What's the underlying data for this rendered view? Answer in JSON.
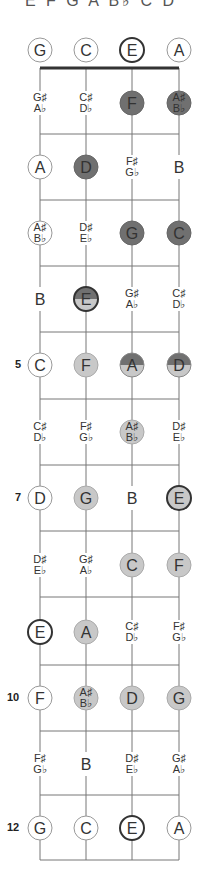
{
  "header": {
    "scale_notes": "E F G A B♭ C D"
  },
  "colors": {
    "line": "#777777",
    "nut": "#333333",
    "dark": "#707070",
    "light": "#c8c8c8",
    "open_outline": "#999999",
    "root_outline": "#333333"
  },
  "strings": [
    {
      "name": "G",
      "x": 40
    },
    {
      "name": "C",
      "x": 86
    },
    {
      "name": "E",
      "x": 132
    },
    {
      "name": "A",
      "x": 179
    }
  ],
  "fret_markers": [
    {
      "fret": 5,
      "label": "5"
    },
    {
      "fret": 7,
      "label": "7"
    },
    {
      "fret": 10,
      "label": "10"
    },
    {
      "fret": 12,
      "label": "12"
    }
  ],
  "rows": [
    {
      "fret": 0,
      "y": 50,
      "cells": [
        {
          "note": "G",
          "style": "open"
        },
        {
          "note": "C",
          "style": "open"
        },
        {
          "note": "E",
          "style": "root"
        },
        {
          "note": "A",
          "style": "open"
        }
      ]
    },
    {
      "fret": 1,
      "y": 103,
      "cells": [
        {
          "note": "G♯/A♭",
          "style": "none"
        },
        {
          "note": "C♯/D♭",
          "style": "none"
        },
        {
          "note": "F",
          "style": "dark"
        },
        {
          "note": "A♯/B♭",
          "style": "dark"
        }
      ]
    },
    {
      "fret": 2,
      "y": 167,
      "cells": [
        {
          "note": "A",
          "style": "open"
        },
        {
          "note": "D",
          "style": "dark"
        },
        {
          "note": "F♯/G♭",
          "style": "none"
        },
        {
          "note": "B",
          "style": "none"
        }
      ]
    },
    {
      "fret": 3,
      "y": 233,
      "cells": [
        {
          "note": "A♯/B♭",
          "style": "open"
        },
        {
          "note": "D♯/E♭",
          "style": "none"
        },
        {
          "note": "G",
          "style": "dark"
        },
        {
          "note": "C",
          "style": "dark"
        }
      ]
    },
    {
      "fret": 4,
      "y": 299,
      "cells": [
        {
          "note": "B",
          "style": "none"
        },
        {
          "note": "E",
          "style": "split-root"
        },
        {
          "note": "G♯/A♭",
          "style": "none"
        },
        {
          "note": "C♯/D♭",
          "style": "none"
        }
      ]
    },
    {
      "fret": 5,
      "y": 365,
      "cells": [
        {
          "note": "C",
          "style": "open"
        },
        {
          "note": "F",
          "style": "light"
        },
        {
          "note": "A",
          "style": "split"
        },
        {
          "note": "D",
          "style": "split"
        }
      ]
    },
    {
      "fret": 6,
      "y": 432,
      "cells": [
        {
          "note": "C♯/D♭",
          "style": "none"
        },
        {
          "note": "F♯/G♭",
          "style": "none"
        },
        {
          "note": "A♯/B♭",
          "style": "light"
        },
        {
          "note": "D♯/E♭",
          "style": "none"
        }
      ]
    },
    {
      "fret": 7,
      "y": 498,
      "cells": [
        {
          "note": "D",
          "style": "open"
        },
        {
          "note": "G",
          "style": "light"
        },
        {
          "note": "B",
          "style": "none"
        },
        {
          "note": "E",
          "style": "light-root"
        }
      ]
    },
    {
      "fret": 8,
      "y": 565,
      "cells": [
        {
          "note": "D♯/E♭",
          "style": "none"
        },
        {
          "note": "G♯/A♭",
          "style": "none"
        },
        {
          "note": "C",
          "style": "light"
        },
        {
          "note": "F",
          "style": "light"
        }
      ]
    },
    {
      "fret": 9,
      "y": 632,
      "cells": [
        {
          "note": "E",
          "style": "root"
        },
        {
          "note": "A",
          "style": "light"
        },
        {
          "note": "C♯/D♭",
          "style": "none"
        },
        {
          "note": "F♯/G♭",
          "style": "none"
        }
      ]
    },
    {
      "fret": 10,
      "y": 698,
      "cells": [
        {
          "note": "F",
          "style": "open"
        },
        {
          "note": "A♯/B♭",
          "style": "light"
        },
        {
          "note": "D",
          "style": "light"
        },
        {
          "note": "G",
          "style": "light"
        }
      ]
    },
    {
      "fret": 11,
      "y": 764,
      "cells": [
        {
          "note": "F♯/G♭",
          "style": "none"
        },
        {
          "note": "B",
          "style": "none"
        },
        {
          "note": "D♯/E♭",
          "style": "none"
        },
        {
          "note": "G♯/A♭",
          "style": "none"
        }
      ]
    },
    {
      "fret": 12,
      "y": 828,
      "cells": [
        {
          "note": "G",
          "style": "open"
        },
        {
          "note": "C",
          "style": "open"
        },
        {
          "note": "E",
          "style": "root"
        },
        {
          "note": "A",
          "style": "open"
        }
      ]
    }
  ],
  "fret_lines_y": [
    134,
    200,
    266,
    332,
    399,
    465,
    531,
    597,
    665,
    731,
    795,
    860
  ],
  "nut_y": 68
}
